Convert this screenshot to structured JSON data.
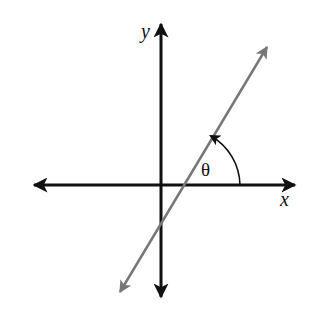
{
  "diagram": {
    "type": "angle-of-line-with-x-axis",
    "labels": {
      "x_axis": "x",
      "y_axis": "y",
      "angle": "θ"
    },
    "colors": {
      "axes": "#111111",
      "line": "#777777",
      "arc": "#111111",
      "background": "#ffffff"
    },
    "geometry": {
      "origin": [
        161,
        185
      ],
      "x_axis": {
        "from": [
          30,
          185
        ],
        "to": [
          298,
          185
        ]
      },
      "y_axis": {
        "from": [
          161,
          20
        ],
        "to": [
          161,
          300
        ]
      },
      "line": {
        "from": [
          118,
          296
        ],
        "to": [
          269,
          44
        ]
      },
      "x_intercept": [
        182,
        185
      ]
    }
  }
}
